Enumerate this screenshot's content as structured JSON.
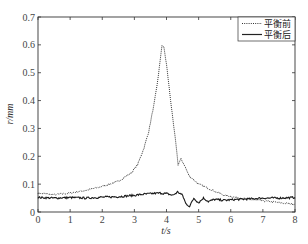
{
  "chart_data": {
    "type": "line",
    "title": "",
    "xlabel": "t/s",
    "ylabel": "r/mm",
    "xlim": [
      0,
      8
    ],
    "ylim": [
      0,
      0.7
    ],
    "xticks": [
      "0",
      "1",
      "2",
      "3",
      "4",
      "5",
      "6",
      "7",
      "8"
    ],
    "yticks": [
      "0",
      "0.1",
      "0.2",
      "0.3",
      "0.4",
      "0.5",
      "0.6",
      "0.7"
    ],
    "grid": false,
    "legend_position": "top-right",
    "series": [
      {
        "name": "平衡前",
        "style": "dotted",
        "x": [
          0,
          0.5,
          1.0,
          1.5,
          2.0,
          2.5,
          2.9,
          3.1,
          3.3,
          3.45,
          3.6,
          3.7,
          3.8,
          3.86,
          3.92,
          4.0,
          4.1,
          4.2,
          4.3,
          4.36,
          4.45,
          4.55,
          4.7,
          5.0,
          5.4,
          5.8,
          6.2,
          6.6,
          7.0,
          7.4,
          7.8,
          8.0
        ],
        "y": [
          0.068,
          0.062,
          0.068,
          0.078,
          0.092,
          0.11,
          0.14,
          0.17,
          0.23,
          0.29,
          0.38,
          0.45,
          0.54,
          0.6,
          0.59,
          0.53,
          0.43,
          0.33,
          0.24,
          0.17,
          0.19,
          0.17,
          0.13,
          0.1,
          0.08,
          0.06,
          0.052,
          0.045,
          0.04,
          0.035,
          0.03,
          0.028
        ]
      },
      {
        "name": "平衡后",
        "style": "solid",
        "x": [
          0,
          0.5,
          1.0,
          1.5,
          2.0,
          2.5,
          3.0,
          3.4,
          3.8,
          4.0,
          4.2,
          4.35,
          4.5,
          4.6,
          4.72,
          4.85,
          5.0,
          5.15,
          5.3,
          5.5,
          5.8,
          6.2,
          6.6,
          7.0,
          7.5,
          8.0
        ],
        "y": [
          0.052,
          0.05,
          0.052,
          0.05,
          0.053,
          0.055,
          0.06,
          0.065,
          0.068,
          0.066,
          0.06,
          0.072,
          0.06,
          0.03,
          0.02,
          0.05,
          0.033,
          0.05,
          0.038,
          0.045,
          0.042,
          0.045,
          0.047,
          0.05,
          0.05,
          0.052
        ]
      }
    ]
  }
}
